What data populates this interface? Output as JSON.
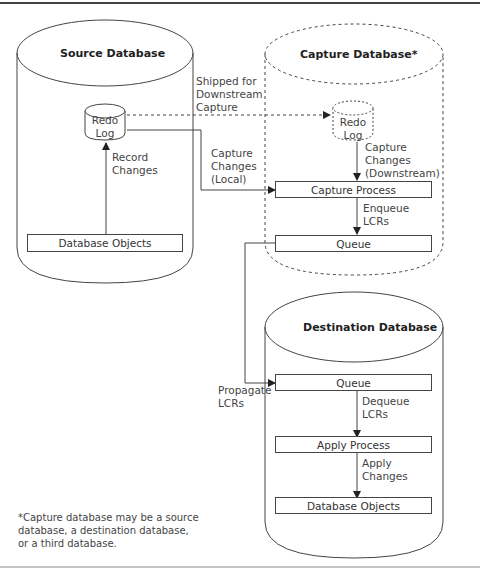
{
  "diagram": {
    "source_db": {
      "title": "Source Database",
      "redo_log": {
        "line1": "Redo",
        "line2": "Log"
      },
      "record_changes": {
        "line1": "Record",
        "line2": "Changes"
      },
      "objects": "Database Objects"
    },
    "capture_db": {
      "title": "Capture Database*",
      "redo_log": {
        "line1": "Redo",
        "line2": "Log"
      },
      "capture_downstream": {
        "line1": "Capture",
        "line2": "Changes",
        "line3": "(Downstream)"
      },
      "capture_process": "Capture Process",
      "enqueue": {
        "line1": "Enqueue",
        "line2": "LCRs"
      },
      "queue": "Queue"
    },
    "shipped": {
      "line1": "Shipped for",
      "line2": "Downstream",
      "line3": "Capture"
    },
    "capture_local": {
      "line1": "Capture",
      "line2": "Changes",
      "line3": "(Local)"
    },
    "propagate": {
      "line1": "Propagate",
      "line2": "LCRs"
    },
    "destination_db": {
      "title": "Destination Database",
      "queue": "Queue",
      "dequeue": {
        "line1": "Dequeue",
        "line2": "LCRs"
      },
      "apply_process": "Apply Process",
      "apply_changes": {
        "line1": "Apply",
        "line2": "Changes"
      },
      "objects": "Database Objects"
    },
    "footnote": {
      "line1": "*Capture database may be a source",
      "line2": "database, a destination database,",
      "line3": "or a third database."
    },
    "colors": {
      "stroke": "#444444",
      "background": "#ffffff"
    }
  }
}
